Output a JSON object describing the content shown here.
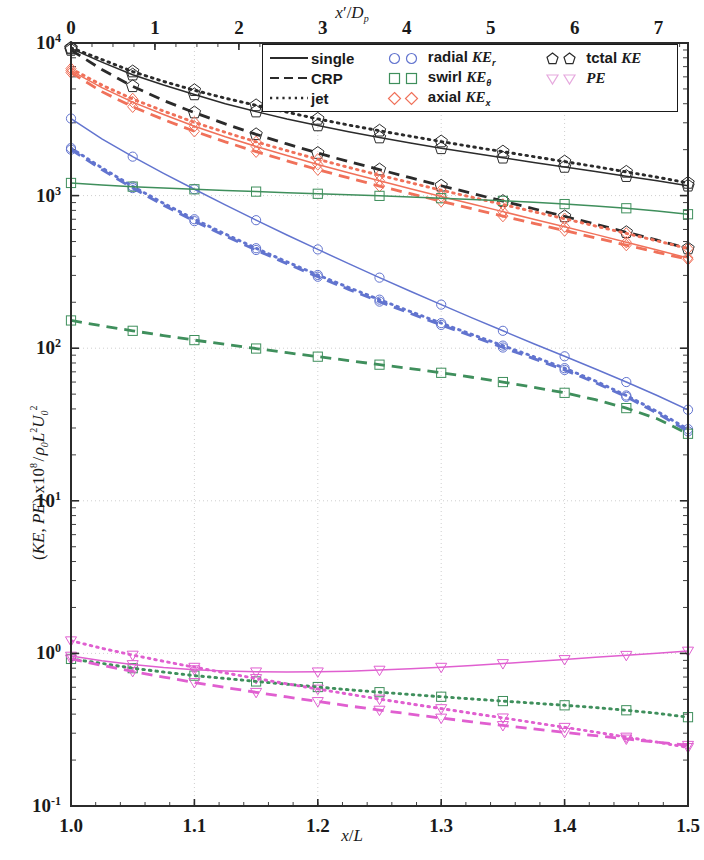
{
  "figure": {
    "kind": "log-linear scientific line plot",
    "background": "#ffffff"
  },
  "axes": {
    "bottom": {
      "label": "x/L",
      "ticks": [
        "1.0",
        "1.1",
        "1.2",
        "1.3",
        "1.4",
        "1.5"
      ],
      "tick_values": [
        1.0,
        1.1,
        1.2,
        1.3,
        1.4,
        1.5
      ],
      "range": [
        1.0,
        1.5
      ],
      "scale": "linear"
    },
    "top": {
      "label": "x'/D_p",
      "label_html": "x&#8242;/D<sub>p</sub>",
      "ticks": [
        "0",
        "1",
        "2",
        "3",
        "4",
        "5",
        "6",
        "7"
      ],
      "tick_values": [
        0,
        1,
        2,
        3,
        4,
        5,
        6,
        7
      ],
      "range": [
        0,
        7.35
      ],
      "scale": "linear"
    },
    "left": {
      "label": "(KE, PE) x10^8 / rho_0 L^2 U_0^2",
      "ticks": [
        "10-1",
        "100",
        "101",
        "102",
        "103",
        "104"
      ],
      "tick_exponents": [
        -1,
        0,
        1,
        2,
        3,
        4
      ],
      "range": [
        0.1,
        10000
      ],
      "scale": "log"
    },
    "grid": "dotted both axes, light gray"
  },
  "legend": {
    "position": "upper right inside axes",
    "columns": [
      {
        "entries": [
          {
            "label": "single",
            "style": "solid",
            "kind": "line"
          },
          {
            "label": "CRP",
            "style": "dashed",
            "kind": "line"
          },
          {
            "label": "jet",
            "style": "dotted",
            "kind": "line"
          }
        ]
      },
      {
        "entries": [
          {
            "label_pre": "radial",
            "sym": "KE",
            "sub": "r",
            "marker": "circle",
            "color": "#6274cf",
            "kind": "marker"
          },
          {
            "label_pre": "swirl",
            "sym": "KE",
            "sub": "θ",
            "marker": "square",
            "color": "#3f8f5c",
            "kind": "marker"
          },
          {
            "label_pre": "axial",
            "sym": "KE",
            "sub": "x",
            "marker": "diamond",
            "color": "#f06a52",
            "kind": "marker"
          }
        ]
      },
      {
        "entries": [
          {
            "label_pre": "tctal",
            "sym": "KE",
            "sub": "",
            "marker": "pentagon",
            "color": "#2b2b2b",
            "kind": "marker"
          },
          {
            "label_pre": "",
            "sym": "PE",
            "sub": "",
            "marker": "triangle-down",
            "color": "#e05fd0",
            "kind": "marker"
          }
        ]
      }
    ]
  },
  "colors": {
    "total_KE": "#2b2b2b",
    "axial_KE": "#f0715a",
    "radial_KE": "#6274cf",
    "swirl_KE": "#3f8f5c",
    "PE": "#e05fd0",
    "grid": "#cfcfcf",
    "axis": "#2b2b2b"
  },
  "chart_data": {
    "type": "line",
    "title": "",
    "xlabel": "x/L",
    "ylabel": "(KE, PE) x10^8 / rho_0 L^2 U_0^2",
    "xlim": [
      1.0,
      1.5
    ],
    "ylim": [
      0.1,
      10000
    ],
    "yscale": "log",
    "xscale": "linear",
    "grid": true,
    "legend_position": "upper-right",
    "x": [
      1.0,
      1.025,
      1.05,
      1.075,
      1.1,
      1.125,
      1.15,
      1.175,
      1.2,
      1.225,
      1.25,
      1.275,
      1.3,
      1.325,
      1.35,
      1.375,
      1.4,
      1.425,
      1.45,
      1.475,
      1.5
    ],
    "series": [
      {
        "name": "total KE, single",
        "quantity": "total KE",
        "config": "single",
        "linestyle": "solid",
        "color": "#2b2b2b",
        "marker": "pentagon",
        "values": [
          9200,
          7500,
          6200,
          5300,
          4600,
          4000,
          3550,
          3180,
          2880,
          2620,
          2400,
          2210,
          2040,
          1900,
          1770,
          1650,
          1540,
          1440,
          1340,
          1250,
          1160
        ]
      },
      {
        "name": "total KE, jet",
        "quantity": "total KE",
        "config": "jet",
        "linestyle": "dotted",
        "color": "#2b2b2b",
        "marker": "pentagon",
        "values": [
          9300,
          7800,
          6500,
          5600,
          4900,
          4350,
          3900,
          3520,
          3180,
          2900,
          2660,
          2450,
          2260,
          2090,
          1940,
          1800,
          1670,
          1550,
          1430,
          1320,
          1210
        ]
      },
      {
        "name": "total KE, CRP",
        "quantity": "total KE",
        "config": "CRP",
        "linestyle": "dashed",
        "color": "#2b2b2b",
        "marker": "pentagon",
        "values": [
          9000,
          6700,
          5200,
          4200,
          3500,
          2950,
          2520,
          2180,
          1900,
          1670,
          1480,
          1310,
          1160,
          1035,
          920,
          820,
          730,
          650,
          575,
          510,
          450
        ]
      },
      {
        "name": "axial KE, single",
        "quantity": "axial KE",
        "config": "single",
        "linestyle": "solid",
        "color": "#f0715a",
        "marker": "diamond",
        "values": [
          6600,
          5100,
          4100,
          3400,
          2850,
          2430,
          2100,
          1830,
          1600,
          1410,
          1250,
          1110,
          985,
          880,
          785,
          700,
          625,
          557,
          495,
          440,
          390
        ]
      },
      {
        "name": "axial KE, jet",
        "quantity": "axial KE",
        "config": "jet",
        "linestyle": "dotted",
        "color": "#f0715a",
        "marker": "diamond",
        "values": [
          6800,
          5300,
          4300,
          3580,
          3020,
          2600,
          2250,
          1970,
          1730,
          1530,
          1360,
          1215,
          1085,
          975,
          875,
          785,
          705,
          632,
          565,
          505,
          450
        ]
      },
      {
        "name": "axial KE, CRP",
        "quantity": "axial KE",
        "config": "CRP",
        "linestyle": "dashed",
        "color": "#f0715a",
        "marker": "diamond",
        "values": [
          6400,
          4800,
          3820,
          3150,
          2640,
          2250,
          1940,
          1690,
          1480,
          1305,
          1155,
          1030,
          918,
          820,
          734,
          658,
          590,
          529,
          474,
          425,
          382
        ]
      },
      {
        "name": "radial KE, single",
        "quantity": "radial KE",
        "config": "single",
        "linestyle": "solid",
        "color": "#6274cf",
        "marker": "circle",
        "values": [
          3200,
          2350,
          1800,
          1400,
          1100,
          870,
          690,
          552,
          444,
          358,
          290,
          236,
          193,
          158,
          130,
          107,
          88.5,
          73.0,
          60.0,
          49.0,
          39.5
        ]
      },
      {
        "name": "radial KE, CRP",
        "quantity": "radial KE",
        "config": "CRP",
        "linestyle": "dashed",
        "color": "#6274cf",
        "marker": "circle",
        "values": [
          2000,
          1480,
          1120,
          865,
          680,
          545,
          440,
          358,
          294,
          243,
          202,
          169,
          142,
          120,
          101,
          85.5,
          72.0,
          59.5,
          48.0,
          37.5,
          28.5
        ]
      },
      {
        "name": "radial KE, jet",
        "quantity": "radial KE",
        "config": "jet",
        "linestyle": "dotted",
        "color": "#6274cf",
        "marker": "circle",
        "values": [
          2050,
          1520,
          1150,
          890,
          700,
          560,
          452,
          368,
          302,
          250,
          208,
          174,
          146,
          123,
          104,
          88.0,
          74.0,
          61.0,
          49.0,
          38.5,
          29.5
        ]
      },
      {
        "name": "swirl KE, single",
        "quantity": "swirl KE",
        "config": "single",
        "linestyle": "solid",
        "color": "#3f8f5c",
        "marker": "square",
        "values": [
          1210,
          1175,
          1145,
          1120,
          1100,
          1080,
          1062,
          1045,
          1028,
          1012,
          996,
          980,
          962,
          944,
          924,
          903,
          880,
          855,
          826,
          793,
          755
        ]
      },
      {
        "name": "swirl KE, CRP",
        "quantity": "swirl KE",
        "config": "CRP",
        "linestyle": "dashed",
        "color": "#3f8f5c",
        "marker": "square",
        "values": [
          152,
          140,
          130,
          121,
          113,
          106,
          99.5,
          93.5,
          88.0,
          83.0,
          78.0,
          73.5,
          69.0,
          64.5,
          60.0,
          55.5,
          51.0,
          46.0,
          40.5,
          34.5,
          27.5
        ]
      },
      {
        "name": "swirl KE, jet",
        "quantity": "swirl KE",
        "config": "jet",
        "linestyle": "dotted",
        "color": "#3f8f5c",
        "marker": "square",
        "values": [
          0.92,
          0.86,
          0.8,
          0.755,
          0.715,
          0.685,
          0.655,
          0.628,
          0.602,
          0.578,
          0.557,
          0.538,
          0.52,
          0.503,
          0.487,
          0.472,
          0.457,
          0.442,
          0.424,
          0.405,
          0.382
        ]
      },
      {
        "name": "PE, single",
        "quantity": "PE",
        "config": "single",
        "linestyle": "solid",
        "color": "#e05fd0",
        "marker": "triangle-down",
        "values": [
          0.96,
          0.895,
          0.845,
          0.808,
          0.782,
          0.766,
          0.757,
          0.754,
          0.757,
          0.765,
          0.777,
          0.793,
          0.812,
          0.834,
          0.858,
          0.884,
          0.912,
          0.942,
          0.972,
          1.004,
          1.036
        ]
      },
      {
        "name": "PE, CRP",
        "quantity": "PE",
        "config": "CRP",
        "linestyle": "dashed",
        "color": "#e05fd0",
        "marker": "triangle-down",
        "values": [
          0.92,
          0.835,
          0.762,
          0.7,
          0.645,
          0.598,
          0.556,
          0.518,
          0.484,
          0.453,
          0.425,
          0.4,
          0.377,
          0.356,
          0.337,
          0.32,
          0.304,
          0.289,
          0.275,
          0.262,
          0.25
        ]
      },
      {
        "name": "PE, jet",
        "quantity": "PE",
        "config": "jet",
        "linestyle": "dotted",
        "color": "#e05fd0",
        "marker": "triangle-down",
        "values": [
          1.21,
          1.08,
          0.975,
          0.888,
          0.812,
          0.745,
          0.685,
          0.632,
          0.584,
          0.541,
          0.502,
          0.467,
          0.435,
          0.405,
          0.378,
          0.352,
          0.328,
          0.305,
          0.283,
          0.262,
          0.242
        ]
      }
    ]
  }
}
